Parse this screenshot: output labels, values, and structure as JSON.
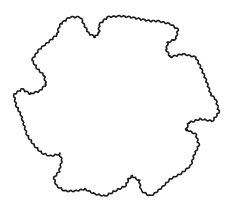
{
  "figure": {
    "background": "#ffffff",
    "stroke_color": "#1a1a1a",
    "width": 231,
    "height": 212,
    "wave_amplitude": 1.6,
    "wave_length": 5,
    "outline_points": [
      [
        62,
        24
      ],
      [
        70,
        18
      ],
      [
        80,
        18
      ],
      [
        83,
        25
      ],
      [
        88,
        34
      ],
      [
        95,
        38
      ],
      [
        100,
        33
      ],
      [
        100,
        25
      ],
      [
        108,
        18
      ],
      [
        120,
        17
      ],
      [
        130,
        18
      ],
      [
        140,
        20
      ],
      [
        150,
        22
      ],
      [
        158,
        22
      ],
      [
        170,
        25
      ],
      [
        177,
        30
      ],
      [
        175,
        38
      ],
      [
        167,
        42
      ],
      [
        165,
        50
      ],
      [
        170,
        58
      ],
      [
        183,
        55
      ],
      [
        195,
        58
      ],
      [
        200,
        68
      ],
      [
        205,
        80
      ],
      [
        210,
        95
      ],
      [
        215,
        100
      ],
      [
        218,
        112
      ],
      [
        212,
        120
      ],
      [
        200,
        118
      ],
      [
        188,
        122
      ],
      [
        185,
        130
      ],
      [
        195,
        135
      ],
      [
        198,
        145
      ],
      [
        193,
        155
      ],
      [
        190,
        165
      ],
      [
        180,
        173
      ],
      [
        170,
        178
      ],
      [
        163,
        185
      ],
      [
        155,
        192
      ],
      [
        150,
        195
      ],
      [
        142,
        190
      ],
      [
        140,
        180
      ],
      [
        132,
        175
      ],
      [
        128,
        178
      ],
      [
        125,
        185
      ],
      [
        115,
        190
      ],
      [
        105,
        195
      ],
      [
        95,
        193
      ],
      [
        85,
        188
      ],
      [
        75,
        190
      ],
      [
        65,
        190
      ],
      [
        57,
        185
      ],
      [
        55,
        178
      ],
      [
        60,
        172
      ],
      [
        63,
        160
      ],
      [
        60,
        153
      ],
      [
        50,
        155
      ],
      [
        42,
        152
      ],
      [
        35,
        145
      ],
      [
        28,
        135
      ],
      [
        25,
        125
      ],
      [
        22,
        115
      ],
      [
        17,
        105
      ],
      [
        15,
        95
      ],
      [
        22,
        90
      ],
      [
        30,
        95
      ],
      [
        40,
        92
      ],
      [
        47,
        85
      ],
      [
        45,
        75
      ],
      [
        38,
        68
      ],
      [
        33,
        60
      ],
      [
        40,
        50
      ],
      [
        50,
        42
      ],
      [
        58,
        35
      ],
      [
        60,
        27
      ]
    ]
  }
}
